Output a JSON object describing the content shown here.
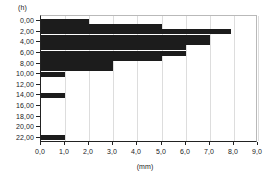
{
  "chart_data": {
    "type": "bar",
    "orientation": "horizontal",
    "title": "",
    "subtitle": "",
    "xlabel": "(mm)",
    "ylabel": "(h)",
    "xlim": [
      0.0,
      9.0
    ],
    "ylim": [
      23.0,
      -1.0
    ],
    "grid": "vertical",
    "legend": null,
    "bar_color": "#1c1c1c",
    "x_ticks": [
      "0,0",
      "1,0",
      "2,0",
      "3,0",
      "4,0",
      "5,0",
      "6,0",
      "7,0",
      "8,0",
      "9,0"
    ],
    "x_tick_values": [
      0.0,
      1.0,
      2.0,
      3.0,
      4.0,
      5.0,
      6.0,
      7.0,
      8.0,
      9.0
    ],
    "y_ticks": [
      "0,00",
      "2,00",
      "4,00",
      "6,00",
      "8,00",
      "10,00",
      "12,00",
      "14,00",
      "16,00",
      "18,00",
      "20,00",
      "22,00"
    ],
    "y_tick_values": [
      0,
      2,
      4,
      6,
      8,
      10,
      12,
      14,
      16,
      18,
      20,
      22
    ],
    "categories": [
      0,
      1,
      2,
      3,
      4,
      5,
      6,
      7,
      8,
      9,
      10,
      11,
      12,
      13,
      14,
      15,
      16,
      17,
      18,
      19,
      20,
      21,
      22,
      23
    ],
    "values": [
      2.0,
      5.0,
      7.9,
      7.0,
      7.0,
      6.0,
      6.0,
      5.0,
      3.0,
      3.0,
      1.0,
      0.0,
      0.0,
      0.0,
      1.0,
      0.0,
      0.0,
      0.0,
      0.0,
      0.0,
      0.0,
      0.0,
      1.0,
      0.0
    ]
  }
}
